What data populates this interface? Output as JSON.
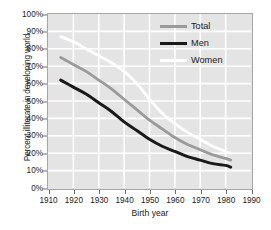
{
  "chart_data": {
    "type": "line",
    "title": "",
    "xlabel": "Birth year",
    "ylabel": "Percent illiterate in developing world",
    "xlim": [
      1910,
      1990
    ],
    "ylim": [
      0,
      100
    ],
    "grid": true,
    "legend_position": "upper-right-inside",
    "x_ticks": [
      "1910",
      "1920",
      "1930",
      "1940",
      "1950",
      "1960",
      "1970",
      "1980",
      "1990"
    ],
    "y_ticks": [
      "0%",
      "10%",
      "20%",
      "30%",
      "40%",
      "50%",
      "60%",
      "70%",
      "80%",
      "90%",
      "100%"
    ],
    "x": [
      1915,
      1920,
      1925,
      1930,
      1935,
      1940,
      1945,
      1950,
      1955,
      1960,
      1965,
      1970,
      1975,
      1980,
      1982
    ],
    "series": [
      {
        "name": "Women",
        "color": "#ffffff",
        "values": [
          87,
          84,
          80,
          76,
          72,
          67,
          60,
          51,
          43,
          37,
          32,
          28,
          24,
          21,
          20
        ]
      },
      {
        "name": "Total",
        "color": "#9a9a9a",
        "values": [
          75,
          71,
          67,
          62,
          57,
          51,
          45,
          39,
          34,
          29,
          25,
          22,
          19,
          17,
          16
        ]
      },
      {
        "name": "Men",
        "color": "#1a1a1a",
        "values": [
          62,
          58,
          54,
          49,
          44,
          38,
          33,
          28,
          24,
          21,
          18,
          16,
          14,
          13,
          12
        ]
      }
    ]
  },
  "legend": {
    "items": [
      {
        "label": "Total",
        "color": "#9a9a9a"
      },
      {
        "label": "Men",
        "color": "#1a1a1a"
      },
      {
        "label": "Women",
        "color": "#ffffff"
      }
    ]
  },
  "axes": {
    "x_title": "Birth year",
    "y_title": "Percent illiterate in developing world"
  },
  "colors": {
    "plot_background": "#e4e4e4",
    "gridline": "#ffffff",
    "frame": "#a6a6a6",
    "page_background": "#ffffff",
    "text": "#1a1a1a"
  }
}
